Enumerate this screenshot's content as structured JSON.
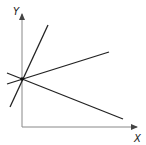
{
  "diagram": {
    "axes": {
      "x_label": "X",
      "y_label": "Y",
      "origin": [
        22,
        127
      ],
      "x_end": [
        138,
        127
      ],
      "y_end": [
        22,
        13
      ]
    },
    "intersection_point": [
      22,
      79
    ],
    "lines": [
      {
        "name": "steep-positive-line",
        "from": [
          10,
          107
        ],
        "to": [
          48,
          25
        ]
      },
      {
        "name": "shallow-positive-line",
        "from": [
          7,
          84
        ],
        "to": [
          109,
          52
        ]
      },
      {
        "name": "negative-slope-line",
        "from": [
          7,
          73
        ],
        "to": [
          123,
          119
        ]
      }
    ],
    "colors": {
      "axis": "#777777",
      "line": "#222222"
    }
  }
}
